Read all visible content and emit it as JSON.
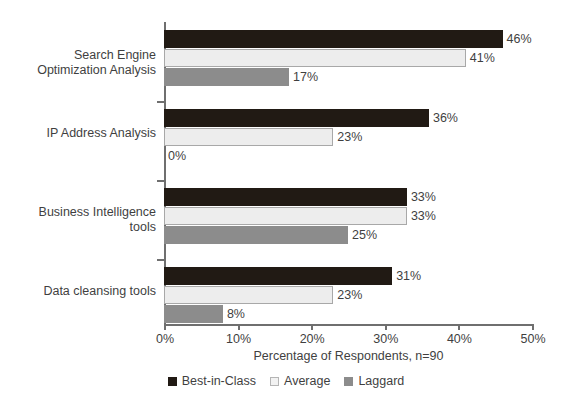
{
  "chart_data": {
    "type": "bar",
    "orientation": "horizontal",
    "title": "",
    "xlabel": "Percentage of Respondents, n=90",
    "ylabel": "",
    "xlim": [
      0,
      50
    ],
    "xticks": [
      "0%",
      "10%",
      "20%",
      "30%",
      "40%",
      "50%"
    ],
    "xtick_values": [
      0,
      10,
      20,
      30,
      40,
      50
    ],
    "grid": false,
    "legend_position": "bottom",
    "categories": [
      "Search Engine Optimization Analysis",
      "IP Address Analysis",
      "Business Intelligence tools",
      "Data cleansing tools"
    ],
    "category_lines": [
      [
        "Search Engine",
        "Optimization Analysis"
      ],
      [
        "IP Address Analysis"
      ],
      [
        "Business Intelligence",
        "tools"
      ],
      [
        "Data cleansing tools"
      ]
    ],
    "series": [
      {
        "name": "Best-in-Class",
        "color": "#211a14",
        "values": [
          46,
          36,
          33,
          31
        ],
        "labels": [
          "46%",
          "36%",
          "33%",
          "31%"
        ]
      },
      {
        "name": "Average",
        "color": "#ededed",
        "values": [
          41,
          23,
          33,
          23
        ],
        "labels": [
          "41%",
          "23%",
          "33%",
          "23%"
        ]
      },
      {
        "name": "Laggard",
        "color": "#8c8c8c",
        "values": [
          17,
          0,
          25,
          8
        ],
        "labels": [
          "17%",
          "0%",
          "25%",
          "8%"
        ]
      }
    ]
  },
  "legend": {
    "items": [
      {
        "label": "Best-in-Class",
        "color": "#211a14"
      },
      {
        "label": "Average",
        "color": "#ededed"
      },
      {
        "label": "Laggard",
        "color": "#8c8c8c"
      }
    ]
  },
  "axis": {
    "x_title": "Percentage of Respondents, n=90",
    "ticks": [
      {
        "label": "0%"
      },
      {
        "label": "10%"
      },
      {
        "label": "20%"
      },
      {
        "label": "30%"
      },
      {
        "label": "40%"
      },
      {
        "label": "50%"
      }
    ]
  }
}
